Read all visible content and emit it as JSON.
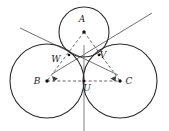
{
  "figure": {
    "width": 169,
    "height": 131,
    "background_color": "#ffffff",
    "stroke_color": "#2b2b2b",
    "dashed_color": "#555555",
    "tangent_line_color": "#4a4a4a",
    "label_color": "#1a1a1a"
  },
  "labels": {
    "A": "A",
    "B": "B",
    "C": "C",
    "U": "U",
    "V": "V",
    "W": "W"
  },
  "chart_data": {
    "type": "scatter",
    "xlabel": "",
    "ylabel": "",
    "xlim": [
      0,
      169
    ],
    "ylim": [
      0,
      131
    ],
    "grid": false,
    "legend": "none",
    "circles": [
      {
        "name": "circle-A",
        "center_label": "A",
        "cx": 84,
        "cy": 32,
        "r": 25
      },
      {
        "name": "circle-B",
        "center_label": "B",
        "cx": 47,
        "cy": 81,
        "r": 37
      },
      {
        "name": "circle-C",
        "center_label": "C",
        "cx": 120,
        "cy": 81,
        "r": 37
      }
    ],
    "centers": [
      {
        "label": "A",
        "x": 84,
        "y": 32,
        "label_x": 82,
        "label_y": 22
      },
      {
        "label": "B",
        "x": 47,
        "y": 81,
        "label_x": 37,
        "label_y": 84
      },
      {
        "label": "C",
        "x": 120,
        "y": 81,
        "label_x": 129,
        "label_y": 84
      }
    ],
    "tangent_points": [
      {
        "label": "W",
        "x": 69,
        "y": 55,
        "label_x": 56,
        "label_y": 62
      },
      {
        "label": "V",
        "x": 99,
        "y": 55,
        "label_x": 103,
        "label_y": 58
      },
      {
        "label": "U",
        "x": 84,
        "y": 81,
        "label_x": 87,
        "label_y": 91
      }
    ],
    "dashed_segments": [
      {
        "name": "A-B",
        "x1": 84,
        "y1": 32,
        "x2": 47,
        "y2": 81
      },
      {
        "name": "A-C",
        "x1": 84,
        "y1": 32,
        "x2": 120,
        "y2": 81
      },
      {
        "name": "B-C",
        "x1": 47,
        "y1": 81,
        "x2": 120,
        "y2": 81
      }
    ],
    "tangent_lines": [
      {
        "name": "tangent-through-W",
        "x1": 20,
        "y1": 28,
        "x2": 118,
        "y2": 75
      },
      {
        "name": "tangent-through-V",
        "x1": 152,
        "y1": 13,
        "x2": 52,
        "y2": 74
      },
      {
        "name": "tangent-through-U",
        "x1": 84,
        "y1": 45,
        "x2": 84,
        "y2": 131
      }
    ]
  }
}
